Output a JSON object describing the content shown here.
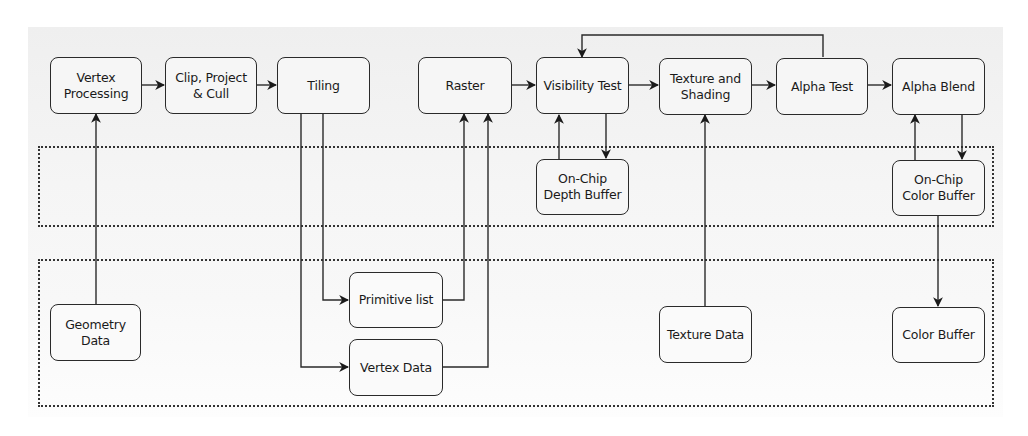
{
  "diagram": {
    "colors": {
      "stroke": "#2a2a2a",
      "node_fill": "#f6f6f6",
      "panel": "#f2f2f2",
      "region_border": "#333333"
    },
    "regions": [
      {
        "id": "on-chip-memory",
        "label": ""
      },
      {
        "id": "off-chip-memory",
        "label": ""
      }
    ],
    "nodes": {
      "vertex_processing": "Vertex\nProcessing",
      "clip_project_cull": "Clip, Project\n& Cull",
      "tiling": "Tiling",
      "raster": "Raster",
      "visibility_test": "Visibility Test",
      "texture_shading": "Texture and\nShading",
      "alpha_test": "Alpha Test",
      "alpha_blend": "Alpha Blend",
      "depth_buffer": "On-Chip\nDepth Buffer",
      "onchip_color_buffer": "On-Chip\nColor Buffer",
      "geometry_data": "Geometry\nData",
      "primitive_list": "Primitive list",
      "vertex_data": "Vertex Data",
      "texture_data": "Texture Data",
      "color_buffer": "Color Buffer"
    },
    "edges": [
      [
        "Vertex Processing",
        "Clip, Project & Cull"
      ],
      [
        "Clip, Project & Cull",
        "Tiling"
      ],
      [
        "Tiling",
        "Primitive list"
      ],
      [
        "Tiling",
        "Vertex Data"
      ],
      [
        "Primitive list",
        "Raster"
      ],
      [
        "Vertex Data",
        "Raster"
      ],
      [
        "Raster",
        "Visibility Test"
      ],
      [
        "Visibility Test",
        "Texture and Shading"
      ],
      [
        "Texture and Shading",
        "Alpha Test"
      ],
      [
        "Alpha Test",
        "Alpha Blend"
      ],
      [
        "Alpha Test",
        "Visibility Test"
      ],
      [
        "Visibility Test",
        "On-Chip Depth Buffer"
      ],
      [
        "On-Chip Depth Buffer",
        "Visibility Test"
      ],
      [
        "Alpha Blend",
        "On-Chip Color Buffer"
      ],
      [
        "On-Chip Color Buffer",
        "Alpha Blend"
      ],
      [
        "On-Chip Color Buffer",
        "Color Buffer"
      ],
      [
        "Geometry Data",
        "Vertex Processing"
      ],
      [
        "Texture Data",
        "Texture and Shading"
      ]
    ]
  }
}
